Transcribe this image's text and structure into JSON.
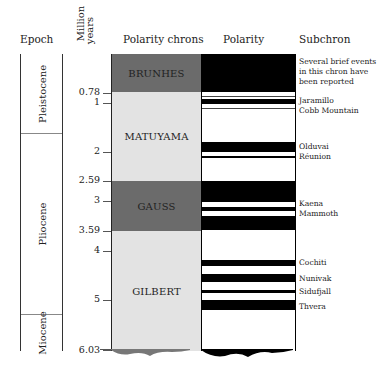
{
  "headers": {
    "epoch": "Epoch",
    "million_years": [
      "Million",
      "years"
    ],
    "polarity_chrons": "Polarity chrons",
    "polarity": "Polarity",
    "subchron": "Subchron"
  },
  "epochs": [
    {
      "name": "Pleistocene",
      "from_ma": 0,
      "to_ma": 1.8
    },
    {
      "name": "Pliocene",
      "from_ma": 1.8,
      "to_ma": 5.3
    },
    {
      "name": "Miocene",
      "from_ma": 5.3,
      "to_ma": 6.03
    }
  ],
  "age_ticks": [
    "0.78",
    "1",
    "2",
    "2.59",
    "3",
    "3.59",
    "4",
    "5",
    "6.03"
  ],
  "chrons": [
    {
      "name": "BRUNHES",
      "from_ma": 0,
      "to_ma": 0.78,
      "color": "#6b6b6b",
      "polarity": "normal"
    },
    {
      "name": "MATUYAMA",
      "from_ma": 0.78,
      "to_ma": 2.59,
      "color": "#e3e3e3",
      "polarity": "reversed"
    },
    {
      "name": "GAUSS",
      "from_ma": 2.59,
      "to_ma": 3.59,
      "color": "#6b6b6b",
      "polarity": "normal"
    },
    {
      "name": "GILBERT",
      "from_ma": 3.59,
      "to_ma": 6.03,
      "color": "#e3e3e3",
      "polarity": "reversed"
    }
  ],
  "subchrons": {
    "brunhes_note": [
      "Several brief events",
      "in this chron have",
      "been reported"
    ],
    "jaramillo": "Jaramillo",
    "cobb_mountain": "Cobb Mountain",
    "olduvai": "Olduvai",
    "reunion": "Réunion",
    "kaena": "Kaena",
    "mammoth": "Mammoth",
    "cochiti": "Cochiti",
    "nunivak": "Nunivak",
    "sidufjall": "Sidufjall",
    "thvera": "Thvera"
  },
  "legend_colors": {
    "normal_polarity": "#000000",
    "reversed_polarity": "#ffffff",
    "normal_chron": "#6b6b6b",
    "reversed_chron": "#e3e3e3"
  }
}
